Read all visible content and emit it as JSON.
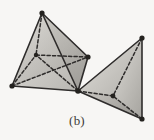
{
  "figure": {
    "caption": "(b)",
    "background_color": "#f7f6f4",
    "edge_color": "#2e2c2b",
    "vertex_color": "#24221f",
    "hidden_edge_style": "dashed",
    "shading": {
      "light_face": "#d9d7d2",
      "mid_face": "#bcbab5",
      "dark_face": "#a3a19c",
      "darker_face": "#8e8c87",
      "highlight_face": "#e4e2de"
    },
    "left_solid": {
      "name": "left-tetrahedron",
      "vertices": {
        "apex": [
          42,
          13
        ],
        "left": [
          12,
          86
        ],
        "right": [
          88,
          57
        ],
        "bottom": [
          78,
          91
        ],
        "hidden_center": [
          36,
          55
        ]
      },
      "visible_edges": [
        [
          "apex",
          "left"
        ],
        [
          "apex",
          "right"
        ],
        [
          "apex",
          "bottom"
        ],
        [
          "left",
          "bottom"
        ],
        [
          "right",
          "bottom"
        ]
      ],
      "hidden_edges": [
        [
          "apex",
          "hidden_center"
        ],
        [
          "left",
          "hidden_center"
        ],
        [
          "right",
          "hidden_center"
        ],
        [
          "bottom",
          "hidden_center"
        ],
        [
          "left",
          "right"
        ]
      ]
    },
    "right_solid": {
      "name": "right-tetrahedron",
      "vertices": {
        "apex": [
          142,
          38
        ],
        "shared": [
          78,
          91
        ],
        "bottom": [
          142,
          119
        ],
        "hidden_center": [
          113,
          96
        ]
      },
      "visible_edges": [
        [
          "apex",
          "shared"
        ],
        [
          "apex",
          "bottom"
        ],
        [
          "shared",
          "bottom"
        ]
      ],
      "hidden_edges": [
        [
          "apex",
          "hidden_center"
        ],
        [
          "shared",
          "hidden_center"
        ],
        [
          "bottom",
          "hidden_center"
        ]
      ]
    },
    "vertex_dots": [
      [
        42,
        13
      ],
      [
        12,
        86
      ],
      [
        88,
        57
      ],
      [
        78,
        91
      ],
      [
        36,
        55
      ],
      [
        142,
        38
      ],
      [
        142,
        119
      ],
      [
        113,
        96
      ]
    ]
  }
}
